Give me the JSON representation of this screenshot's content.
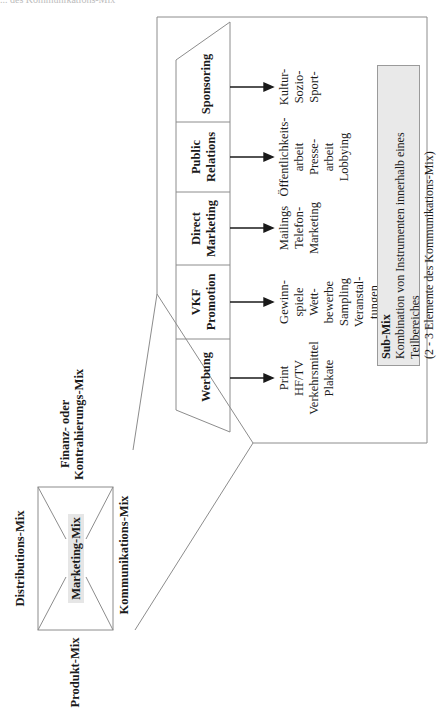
{
  "header_cut_text": "... des Kommunikations-Mix",
  "marketing_mix": {
    "center_label": "Marketing-Mix",
    "sides": {
      "top": "Distributions-Mix",
      "bottom": "Kommunikations-Mix",
      "left": "Produkt-Mix",
      "right_line1": "Finanz- oder",
      "right_line2": "Kontrahierungs-Mix"
    }
  },
  "communication_mix": {
    "columns": [
      {
        "title_lines": [
          "Werbung"
        ],
        "items": [
          "Print",
          "HF/TV",
          "Verkehrsmittel",
          "Plakate"
        ]
      },
      {
        "title_lines": [
          "VKF",
          "Promotion"
        ],
        "items": [
          "Gewinn-",
          "spiele",
          "Wett-",
          "bewerbe",
          "Sampling",
          "Veranstal-",
          "tungen"
        ]
      },
      {
        "title_lines": [
          "Direct",
          "Marketing"
        ],
        "items": [
          "Mailings",
          "Telefon-",
          "Marketing"
        ]
      },
      {
        "title_lines": [
          "Public",
          "Relations"
        ],
        "items": [
          "Öffentlichkeits-",
          "arbeit",
          "Presse-",
          "arbeit",
          "Lobbying"
        ]
      },
      {
        "title_lines": [
          "Sponsoring"
        ],
        "items": [
          "Kultur-",
          "Sozio-",
          "Sport-"
        ]
      }
    ]
  },
  "sub_mix": {
    "title": "Sub-Mix",
    "line1": "Kombination von Instrumenten innerhalb eines Teilbereiches",
    "line2": "(2 - 3 Elemente des Kommunikations-Mix)"
  },
  "colors": {
    "line": "#8c8c8c",
    "arrow": "#1a1a1a",
    "highlight_bg": "#e6e6e6",
    "submix_bg": "#e9e9e9"
  }
}
